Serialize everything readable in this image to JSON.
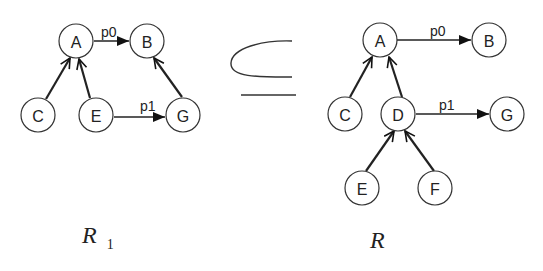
{
  "left_graph": {
    "caption": "R",
    "caption_sub": "1",
    "nodes": [
      {
        "id": "A",
        "label": "A",
        "x": 76,
        "y": 41
      },
      {
        "id": "B",
        "label": "B",
        "x": 147,
        "y": 41
      },
      {
        "id": "C",
        "label": "C",
        "x": 38,
        "y": 115
      },
      {
        "id": "E",
        "label": "E",
        "x": 96,
        "y": 115
      },
      {
        "id": "G",
        "label": "G",
        "x": 183,
        "y": 115
      }
    ],
    "edges": [
      {
        "from": "A",
        "to": "B",
        "label": "p0",
        "type": "labeled"
      },
      {
        "from": "C",
        "to": "A",
        "type": "parent"
      },
      {
        "from": "E",
        "to": "A",
        "type": "parent"
      },
      {
        "from": "G",
        "to": "B",
        "type": "parent"
      },
      {
        "from": "E",
        "to": "G",
        "label": "p1",
        "type": "labeled"
      }
    ]
  },
  "relation_symbol": {
    "symbol": "⊆",
    "meaning": "subset-or-equal"
  },
  "right_graph": {
    "caption": "R",
    "nodes": [
      {
        "id": "A",
        "label": "A",
        "x": 380,
        "y": 40
      },
      {
        "id": "B",
        "label": "B",
        "x": 489,
        "y": 40
      },
      {
        "id": "C",
        "label": "C",
        "x": 345,
        "y": 114
      },
      {
        "id": "D",
        "label": "D",
        "x": 398,
        "y": 114
      },
      {
        "id": "G",
        "label": "G",
        "x": 507,
        "y": 114
      },
      {
        "id": "E",
        "label": "E",
        "x": 362,
        "y": 188
      },
      {
        "id": "F",
        "label": "F",
        "x": 435,
        "y": 188
      }
    ],
    "edges": [
      {
        "from": "A",
        "to": "B",
        "label": "p0",
        "type": "labeled"
      },
      {
        "from": "C",
        "to": "A",
        "type": "parent"
      },
      {
        "from": "D",
        "to": "A",
        "type": "parent"
      },
      {
        "from": "D",
        "to": "G",
        "label": "p1",
        "type": "labeled"
      },
      {
        "from": "E",
        "to": "D",
        "type": "parent"
      },
      {
        "from": "F",
        "to": "D",
        "type": "parent"
      }
    ]
  }
}
